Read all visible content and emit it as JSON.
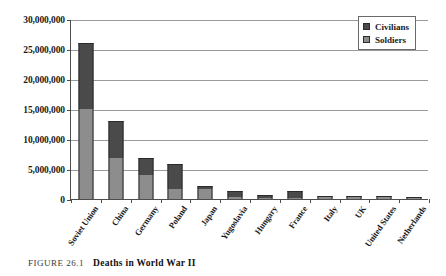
{
  "caption": {
    "figure_number": "FIGURE 26.1",
    "title": "Deaths in World War II"
  },
  "legend": {
    "position": "top-right",
    "items": [
      {
        "label": "Civilians",
        "color": "#4a4a4a"
      },
      {
        "label": "Soldiers",
        "color": "#8d8d8d"
      }
    ]
  },
  "chart_data": {
    "type": "bar",
    "stacked": true,
    "title": "Deaths in World War II",
    "xlabel": "",
    "ylabel": "",
    "ylim": [
      0,
      30000000
    ],
    "grid": true,
    "legend_position": "top-right",
    "ytick_labels": [
      "0",
      "5,000,000",
      "10,000,000",
      "15,000,000",
      "20,000,000",
      "25,000,000",
      "30,000,000"
    ],
    "ytick_values": [
      0,
      5000000,
      10000000,
      15000000,
      20000000,
      25000000,
      30000000
    ],
    "categories": [
      "Soviet Union",
      "China",
      "Germany",
      "Poland",
      "Japan",
      "Yugoslavia",
      "Hungary",
      "France",
      "Italy",
      "UK",
      "United States",
      "Netherlands"
    ],
    "series": [
      {
        "name": "Soldiers",
        "color": "#8d8d8d",
        "values": [
          15000000,
          6900000,
          4000000,
          1600000,
          1600000,
          400000,
          200000,
          250000,
          300000,
          300000,
          400000,
          150000
        ]
      },
      {
        "name": "Civilians",
        "color": "#4a4a4a",
        "values": [
          11000000,
          6100000,
          2900000,
          4300000,
          500000,
          1000000,
          400000,
          1050000,
          150000,
          100000,
          50000,
          250000
        ]
      }
    ],
    "totals": [
      26000000,
      13000000,
      6900000,
      5900000,
      2100000,
      1400000,
      600000,
      1300000,
      450000,
      400000,
      450000,
      400000
    ]
  }
}
